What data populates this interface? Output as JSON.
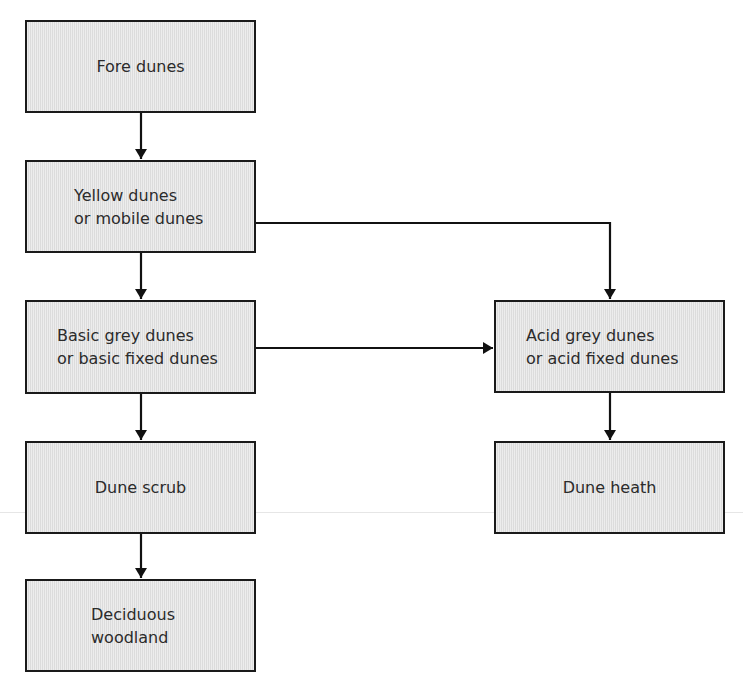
{
  "diagram": {
    "type": "flowchart",
    "nodes": [
      {
        "id": "fore",
        "label": "Fore dunes"
      },
      {
        "id": "yellow",
        "label": "Yellow dunes\nor mobile dunes"
      },
      {
        "id": "basic_grey",
        "label": "Basic grey dunes\nor basic fixed dunes"
      },
      {
        "id": "acid_grey",
        "label": "Acid grey dunes\nor acid fixed dunes"
      },
      {
        "id": "scrub",
        "label": "Dune scrub"
      },
      {
        "id": "heath",
        "label": "Dune heath"
      },
      {
        "id": "woodland",
        "label": "Deciduous\nwoodland"
      }
    ],
    "edges": [
      {
        "from": "fore",
        "to": "yellow"
      },
      {
        "from": "yellow",
        "to": "basic_grey"
      },
      {
        "from": "yellow",
        "to": "acid_grey"
      },
      {
        "from": "basic_grey",
        "to": "acid_grey"
      },
      {
        "from": "basic_grey",
        "to": "scrub"
      },
      {
        "from": "acid_grey",
        "to": "heath"
      },
      {
        "from": "scrub",
        "to": "woodland"
      }
    ],
    "colors": {
      "box_fill": "#e3e3e3",
      "box_border": "#1a1a1a",
      "text": "#2b2b2b",
      "arrow": "#111111"
    }
  }
}
